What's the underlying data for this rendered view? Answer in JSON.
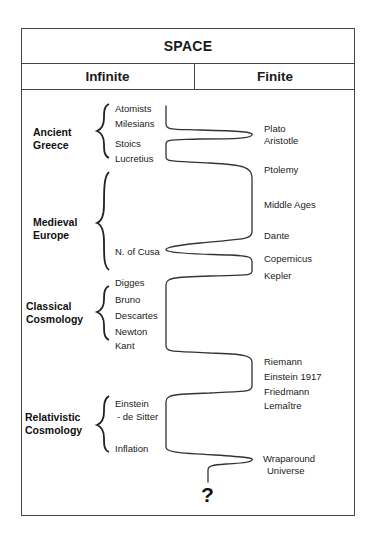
{
  "title": "SPACE",
  "columns": {
    "left": "Infinite",
    "right": "Finite"
  },
  "eras": [
    {
      "label": "Ancient\nGreece",
      "x": 33,
      "y": 126
    },
    {
      "label": "Medieval\nEurope",
      "x": 33,
      "y": 216
    },
    {
      "label": "Classical\nCosmology",
      "x": 26,
      "y": 300
    },
    {
      "label": "Relativistic\nCosmology",
      "x": 25,
      "y": 411
    }
  ],
  "infinite_items": [
    {
      "label": "Atomists",
      "x": 115,
      "y": 103
    },
    {
      "label": "Milesians",
      "x": 115,
      "y": 118
    },
    {
      "label": "Stoics",
      "x": 115,
      "y": 138
    },
    {
      "label": "Lucretius",
      "x": 115,
      "y": 153
    },
    {
      "label": "N. of Cusa",
      "x": 115,
      "y": 246
    },
    {
      "label": "Digges",
      "x": 115,
      "y": 277
    },
    {
      "label": "Bruno",
      "x": 115,
      "y": 294
    },
    {
      "label": "Descartes",
      "x": 115,
      "y": 310
    },
    {
      "label": "Newton",
      "x": 115,
      "y": 326
    },
    {
      "label": "Kant",
      "x": 115,
      "y": 340
    },
    {
      "label": "Einstein",
      "x": 115,
      "y": 398
    },
    {
      "label": "- de Sitter",
      "x": 117,
      "y": 411
    },
    {
      "label": "Inflation",
      "x": 115,
      "y": 443
    }
  ],
  "finite_items": [
    {
      "label": "Plato",
      "x": 264,
      "y": 123
    },
    {
      "label": "Aristotle",
      "x": 264,
      "y": 135
    },
    {
      "label": "Ptolemy",
      "x": 264,
      "y": 164
    },
    {
      "label": "Middle Ages",
      "x": 264,
      "y": 199
    },
    {
      "label": "Dante",
      "x": 264,
      "y": 230
    },
    {
      "label": "Copernicus",
      "x": 264,
      "y": 253
    },
    {
      "label": "Kepler",
      "x": 264,
      "y": 270
    },
    {
      "label": "Riemann",
      "x": 264,
      "y": 356
    },
    {
      "label": "Einstein 1917",
      "x": 264,
      "y": 371
    },
    {
      "label": "Friedmann",
      "x": 264,
      "y": 386
    },
    {
      "label": "Lemaître",
      "x": 264,
      "y": 400
    },
    {
      "label": "Wraparound",
      "x": 263,
      "y": 453
    },
    {
      "label": "Universe",
      "x": 267,
      "y": 465
    }
  ],
  "ending_mark": "?",
  "colors": {
    "line": "#333333",
    "border": "#444444",
    "text": "#1a1a1a"
  }
}
